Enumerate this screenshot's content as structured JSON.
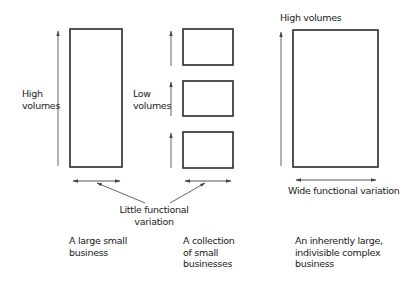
{
  "diagram": {
    "panels": [
      {
        "id": "large-small-business",
        "volume_label": [
          "High",
          "volumes"
        ],
        "caption": [
          "A large small",
          "business"
        ],
        "boxes": 1
      },
      {
        "id": "collection-of-small-businesses",
        "volume_label": [
          "Low",
          "volumes"
        ],
        "caption": [
          "A collection",
          "of small",
          "businesses"
        ],
        "boxes": 3
      },
      {
        "id": "inherently-large-complex-business",
        "volume_label": [
          "High volumes"
        ],
        "variation_label": "Wide functional variation",
        "caption": [
          "An inherently large,",
          "indivisible complex",
          "business"
        ],
        "boxes": 1
      }
    ],
    "shared_annotation": [
      "Little functional",
      "variation"
    ]
  },
  "colors": {
    "stroke": "#2a2a2a",
    "arrow": "#555555",
    "text": "#1a1a1a"
  }
}
